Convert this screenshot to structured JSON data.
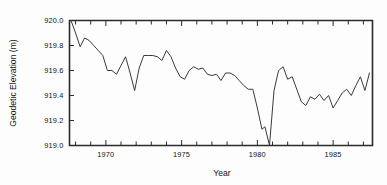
{
  "figure": {
    "background_color": "#fdfdfd",
    "axis_color": "#2b2b2b",
    "line_color": "#3a3a3a"
  },
  "chart_data": {
    "type": "line",
    "title": "",
    "subtitle": "",
    "xlabel": "Year",
    "ylabel": "Geodetic Elevation (m)",
    "xlim": [
      1967.6,
      1987.6
    ],
    "ylim": [
      919.0,
      920.0
    ],
    "grid": false,
    "legend": "none",
    "x_tick_labels": [
      "1970",
      "1975",
      "1980",
      "1985"
    ],
    "x_tick_values": [
      1970,
      1975,
      1980,
      1985
    ],
    "x_minor_tick_interval": 1,
    "y_tick_labels": [
      "919.0",
      "919.2",
      "919.4",
      "919.6",
      "919.8",
      "920.0"
    ],
    "y_tick_values": [
      919.0,
      919.2,
      919.4,
      919.6,
      919.8,
      920.0
    ],
    "series": [
      {
        "name": "Geodetic Elevation",
        "x": [
          1967.7,
          1968.0,
          1968.3,
          1968.6,
          1968.9,
          1969.2,
          1969.5,
          1969.8,
          1970.1,
          1970.4,
          1970.7,
          1971.0,
          1971.3,
          1971.6,
          1971.9,
          1972.2,
          1972.5,
          1972.8,
          1973.1,
          1973.4,
          1973.7,
          1974.0,
          1974.3,
          1974.6,
          1974.9,
          1975.2,
          1975.5,
          1975.8,
          1976.1,
          1976.4,
          1976.7,
          1977.0,
          1977.3,
          1977.6,
          1977.9,
          1978.2,
          1978.5,
          1978.8,
          1979.1,
          1979.4,
          1979.7,
          1980.0,
          1980.3,
          1980.5,
          1980.8,
          1981.1,
          1981.4,
          1981.7,
          1982.0,
          1982.3,
          1982.6,
          1982.9,
          1983.2,
          1983.5,
          1983.8,
          1984.1,
          1984.4,
          1984.7,
          1985.0,
          1985.3,
          1985.6,
          1985.9,
          1986.2,
          1986.5,
          1986.8,
          1987.1,
          1987.4
        ],
        "y": [
          920.0,
          919.9,
          919.79,
          919.86,
          919.84,
          919.8,
          919.76,
          919.72,
          919.6,
          919.6,
          919.57,
          919.64,
          919.71,
          919.58,
          919.44,
          919.62,
          919.72,
          919.72,
          919.72,
          919.71,
          919.68,
          919.76,
          919.71,
          919.62,
          919.55,
          919.53,
          919.6,
          919.63,
          919.61,
          919.62,
          919.57,
          919.56,
          919.57,
          919.52,
          919.58,
          919.58,
          919.56,
          919.52,
          919.48,
          919.45,
          919.45,
          919.3,
          919.13,
          919.15,
          919.0,
          919.44,
          919.6,
          919.63,
          919.53,
          919.55,
          919.45,
          919.35,
          919.32,
          919.39,
          919.37,
          919.41,
          919.36,
          919.4,
          919.3,
          919.36,
          919.42,
          919.45,
          919.4,
          919.48,
          919.55,
          919.44,
          919.58
        ]
      }
    ]
  }
}
